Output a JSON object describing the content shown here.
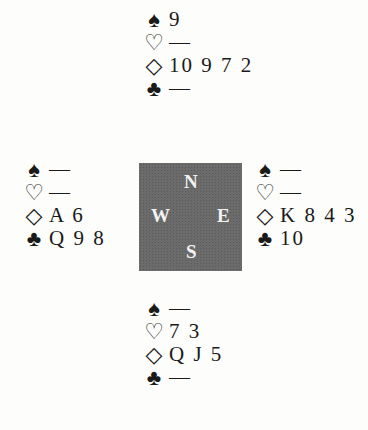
{
  "suits": {
    "spades": "♠",
    "hearts": "♡",
    "diamonds": "◇",
    "clubs": "♣"
  },
  "compass": {
    "north": "N",
    "west": "W",
    "east": "E",
    "south": "S"
  },
  "hands": {
    "north": {
      "spades": "9",
      "hearts": "—",
      "diamonds": "10 9 7 2",
      "clubs": "—"
    },
    "west": {
      "spades": "—",
      "hearts": "—",
      "diamonds": "A 6",
      "clubs": "Q 9 8"
    },
    "east": {
      "spades": "—",
      "hearts": "—",
      "diamonds": "K 8 4 3",
      "clubs": "10"
    },
    "south": {
      "spades": "—",
      "hearts": "7 3",
      "diamonds": "Q J 5",
      "clubs": "—"
    }
  },
  "colors": {
    "compass_bg": "#6b6b6b",
    "compass_text": "#f2f2f2",
    "ink": "#1a1a1a"
  }
}
